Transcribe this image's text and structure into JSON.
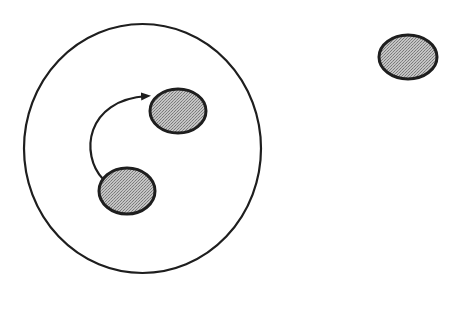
{
  "diagram": {
    "colors": {
      "background": "#ffffff",
      "stroke": "#1e1e1e",
      "fill_shade": "#b4b4b4",
      "fill_dot": "#7a7a7a"
    },
    "container": {
      "shape": "circle",
      "cx": 142.5,
      "cy": 148.5,
      "rx": 118.5,
      "ry": 124.5
    },
    "nodes": [
      {
        "id": "inner-upper",
        "shape": "ellipse",
        "cx": 178,
        "cy": 111,
        "rx": 28,
        "ry": 22,
        "inside_container": true
      },
      {
        "id": "inner-lower",
        "shape": "ellipse",
        "cx": 127,
        "cy": 191,
        "rx": 28,
        "ry": 23,
        "inside_container": true
      },
      {
        "id": "outside-right",
        "shape": "ellipse",
        "cx": 408,
        "cy": 57,
        "rx": 29,
        "ry": 22,
        "inside_container": false
      }
    ],
    "edges": [
      {
        "from": "inner-lower",
        "to": "inner-upper",
        "type": "curved-arrow",
        "path": "M 103 179 C 80 155, 85 100, 150 96"
      }
    ]
  }
}
